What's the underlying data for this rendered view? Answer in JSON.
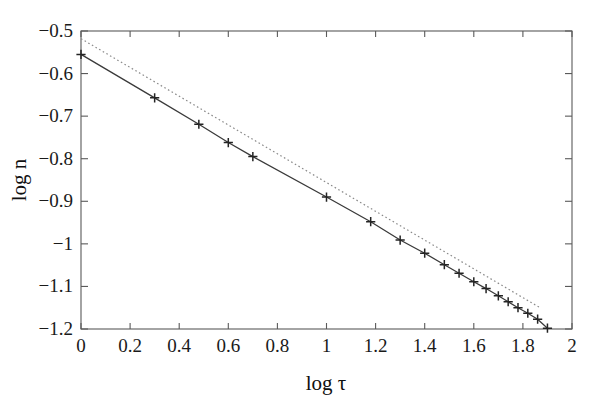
{
  "chart_data": {
    "type": "line",
    "title": "",
    "xlabel": "log τ",
    "ylabel": "log n",
    "xlim": [
      0,
      2
    ],
    "ylim": [
      -1.2,
      -0.5
    ],
    "grid": false,
    "legend": "none",
    "xticks": [
      0,
      0.2,
      0.4,
      0.6,
      0.8,
      1,
      1.2,
      1.4,
      1.6,
      1.8,
      2
    ],
    "xticklabels": [
      "0",
      "0.2",
      "0.4",
      "0.6",
      "0.8",
      "1",
      "1.2",
      "1.4",
      "1.6",
      "1.8",
      "2"
    ],
    "yticks": [
      -0.5,
      -0.6,
      -0.7,
      -0.8,
      -0.9,
      -1,
      -1.1,
      -1.2
    ],
    "yticklabels": [
      "-0.5",
      "-0.6",
      "-0.7",
      "-0.8",
      "-0.9",
      "-1",
      "-1.1",
      "-1.2"
    ],
    "series": [
      {
        "name": "measured decay",
        "style": "solid-line-with-plus-markers",
        "color": "#3a3a3a",
        "marker": "plus",
        "x": [
          0.0,
          0.3,
          0.48,
          0.6,
          0.7,
          1.0,
          1.18,
          1.3,
          1.4,
          1.48,
          1.54,
          1.6,
          1.65,
          1.7,
          1.74,
          1.78,
          1.82,
          1.86,
          1.9
        ],
        "y": [
          -0.555,
          -0.657,
          -0.719,
          -0.762,
          -0.795,
          -0.89,
          -0.948,
          -0.991,
          -1.022,
          -1.049,
          -1.069,
          -1.089,
          -1.105,
          -1.122,
          -1.136,
          -1.15,
          -1.163,
          -1.177,
          -1.198
        ]
      },
      {
        "name": "reference slope",
        "style": "dotted-line",
        "color": "#8a8a8a",
        "marker": "none",
        "x": [
          0.0,
          1.87
        ],
        "y": [
          -0.518,
          -1.15
        ]
      }
    ],
    "annotations": []
  },
  "axes": {
    "x_title": "log τ",
    "y_title": "log n"
  }
}
